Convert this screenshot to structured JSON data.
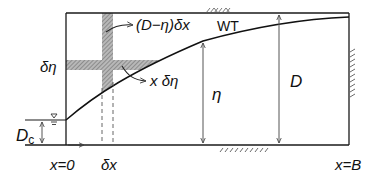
{
  "diagram": {
    "type": "groundwater-flow-schematic",
    "labels": {
      "delta_eta": "δη",
      "strip_vertical_expr": "(D−η)δx",
      "strip_horizontal_expr": "x δη",
      "water_table": "WT",
      "eta": "η",
      "depth_D": "D",
      "critical_depth_D": "D",
      "critical_depth_sub": "c",
      "x_origin": "x=0",
      "delta_x": "δx",
      "x_end": "x=B"
    },
    "colors": {
      "line": "#1a1a1a",
      "arrow": "#555555",
      "hatch": "#8a8a8a",
      "background": "#ffffff"
    }
  }
}
